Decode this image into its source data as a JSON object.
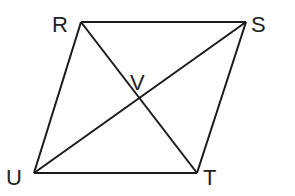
{
  "diagram": {
    "type": "parallelogram-with-diagonals",
    "stroke_color": "#1a1a1a",
    "background": "#ffffff",
    "vertices": {
      "R": {
        "label": "R",
        "x": 81,
        "y": 22
      },
      "S": {
        "label": "S",
        "x": 246,
        "y": 22
      },
      "T": {
        "label": "T",
        "x": 197,
        "y": 173
      },
      "U": {
        "label": "U",
        "x": 34,
        "y": 173
      }
    },
    "intersection": {
      "label": "V",
      "x": 140,
      "y": 98
    },
    "segments": [
      [
        "R",
        "S"
      ],
      [
        "S",
        "T"
      ],
      [
        "T",
        "U"
      ],
      [
        "U",
        "R"
      ],
      [
        "R",
        "T"
      ],
      [
        "U",
        "S"
      ]
    ],
    "labels": {
      "R": "R",
      "S": "S",
      "T": "T",
      "U": "U",
      "V": "V"
    }
  }
}
